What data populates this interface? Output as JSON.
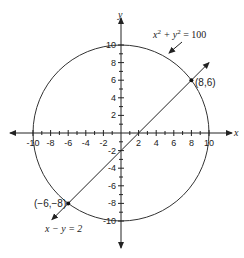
{
  "diagram": {
    "type": "coordinate-plane",
    "axes": {
      "x_label": "x",
      "y_label": "y",
      "x_ticks": [
        "-10",
        "-8",
        "-6",
        "-4",
        "-2",
        "2",
        "4",
        "6",
        "8",
        "10"
      ],
      "y_ticks_positive": [
        "10",
        "8",
        "6",
        "4",
        "2"
      ],
      "y_ticks_negative": [
        "-2",
        "-4",
        "-6",
        "-8",
        "-10"
      ]
    },
    "circle": {
      "equation_lhs": "x",
      "equation_sup1": "2",
      "equation_plus": " + y",
      "equation_sup2": "2",
      "equation_rhs": " = 100",
      "radius": 10
    },
    "line": {
      "equation": "x − y = 2"
    },
    "points": [
      {
        "label": "(8,6)",
        "x": 8,
        "y": 6
      },
      {
        "label": "(−6,−8)",
        "x": -6,
        "y": -8
      }
    ],
    "colors": {
      "stroke": "#222222",
      "background": "#ffffff"
    }
  }
}
